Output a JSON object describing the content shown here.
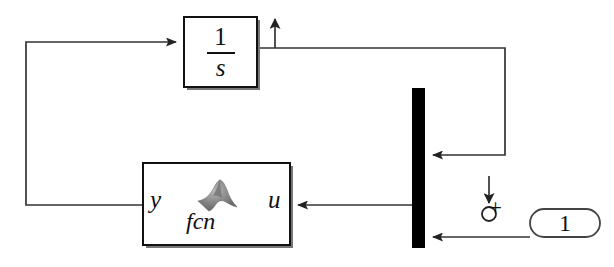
{
  "diagram": {
    "background_color": "#ffffff",
    "line_color": "#333333",
    "block_border_color": "#111111",
    "mux_color": "#000000"
  },
  "blocks": {
    "integrator": {
      "name": "integrator-block",
      "numerator": "1",
      "denominator": "s",
      "x": 184,
      "y": 17,
      "w": 73,
      "h": 70
    },
    "function_block": {
      "name": "matlab-function-block",
      "input_port_label": "u",
      "output_port_label": "y",
      "caption": "fcn",
      "icon": "matlab-membrane-logo",
      "x": 143,
      "y": 163,
      "w": 147,
      "h": 82
    },
    "mux": {
      "name": "mux-block",
      "label": "",
      "x": 412,
      "y": 88,
      "w": 13,
      "h": 160
    },
    "constant": {
      "name": "constant-block",
      "value": "1",
      "shape": "rounded-pill",
      "x": 530,
      "y": 209,
      "w": 70,
      "h": 28
    }
  },
  "annotations": {
    "sum_port": {
      "name": "sum-junction-marker",
      "sign": "+",
      "circle_cx": 489,
      "circle_cy": 214,
      "circle_r": 7
    },
    "output_arrow": {
      "name": "output-port-arrow",
      "direction": "up",
      "x": 275,
      "y_top": 10,
      "y_bottom": 48
    },
    "input_arrow": {
      "name": "input-port-arrow",
      "direction": "down",
      "x": 489,
      "y_top": 176,
      "y_bottom": 204
    }
  },
  "signals": [
    {
      "name": "integrator-output-to-mux",
      "from": "integrator",
      "to": "mux-upper-input"
    },
    {
      "name": "feedback-y-to-integrator-input",
      "from": "function-block-y",
      "to": "integrator-input"
    },
    {
      "name": "mux-output-to-function-u",
      "from": "mux",
      "to": "function-block-u"
    },
    {
      "name": "constant-to-mux-lower-input",
      "from": "constant",
      "to": "mux-lower-input"
    }
  ]
}
